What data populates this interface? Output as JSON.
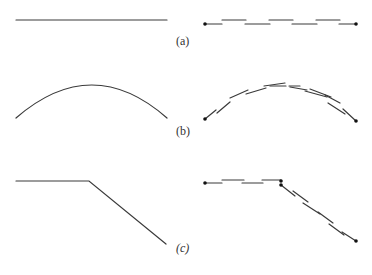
{
  "figure": {
    "panels": [
      {
        "id": "a",
        "label": "(a)",
        "left_shape": "straight-line",
        "right_shape": "segmented-straight-line"
      },
      {
        "id": "b",
        "label": "(b)",
        "left_shape": "arc",
        "right_shape": "segmented-arc"
      },
      {
        "id": "c",
        "label": "(c)",
        "left_shape": "bent-line",
        "right_shape": "segmented-bent-line"
      }
    ],
    "colors": {
      "stroke": "#3a3a3a",
      "background": "#ffffff"
    }
  }
}
